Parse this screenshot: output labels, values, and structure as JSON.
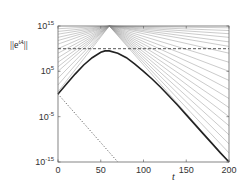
{
  "chart_data": {
    "type": "line",
    "title": "",
    "xlabel": "t",
    "ylabel": "||e^{tA}||",
    "yscale": "log",
    "xlim": [
      0,
      200
    ],
    "ylim_exponent": [
      -15,
      15
    ],
    "x_ticks": [
      0,
      50,
      100,
      150,
      200
    ],
    "y_ticks": [
      {
        "base": "10",
        "exp": "15",
        "value_exp": 15
      },
      {
        "base": "10",
        "exp": "5",
        "value_exp": 5
      },
      {
        "base": "10",
        "exp": "-5",
        "value_exp": -5
      },
      {
        "base": "10",
        "exp": "-15",
        "value_exp": -15
      }
    ],
    "grid": false,
    "legend": null,
    "series": [
      {
        "name": "norm of e^{tA} (thick solid)",
        "style": "solid-thick",
        "color": "#222222",
        "t": [
          0,
          10,
          20,
          30,
          40,
          50,
          55,
          60,
          70,
          80,
          90,
          100,
          110,
          120,
          130,
          140,
          150,
          160,
          170,
          180,
          190,
          200
        ],
        "log10_y": [
          0,
          2.2,
          4.4,
          6.4,
          8.0,
          9.2,
          9.5,
          9.5,
          9.0,
          8.0,
          6.6,
          5.0,
          3.3,
          1.5,
          -0.5,
          -2.5,
          -4.6,
          -6.7,
          -8.8,
          -10.9,
          -13.0,
          -15.0
        ]
      },
      {
        "name": "spectral bound (dotted)",
        "style": "dotted",
        "color": "#555555",
        "t": [
          0,
          70
        ],
        "log10_y": [
          0,
          -15
        ]
      },
      {
        "name": "reference level (dashed)",
        "style": "dashed",
        "color": "#444444",
        "t": [
          0,
          200
        ],
        "log10_y": [
          10,
          10
        ]
      },
      {
        "name": "pseudospectral bounds (thin fan)",
        "style": "thin",
        "color": "#8a8a8a",
        "note": "family of ~30 straight lines in log scale, rising from t=0 and converging near t≈60 at 10^15, then decaying with varied slopes to t=200",
        "apex": {
          "t": 60,
          "log10_y": 15
        },
        "left_intercepts_log10": [
          0.5,
          2,
          3.5,
          5,
          6,
          7,
          8,
          9,
          10,
          11,
          11.8,
          12.5,
          13.2,
          13.8,
          14.4
        ],
        "right_end_log10": [
          -15,
          -13,
          -11,
          -9,
          -7,
          -5,
          -3,
          -1,
          1,
          3,
          5,
          7,
          9,
          10.5,
          11.5,
          12.5,
          13.3,
          14,
          14.6
        ]
      }
    ]
  },
  "axes": {
    "xlabel": "t",
    "ylabel_main": "||e",
    "ylabel_sup": "tA",
    "ylabel_end": "||"
  }
}
